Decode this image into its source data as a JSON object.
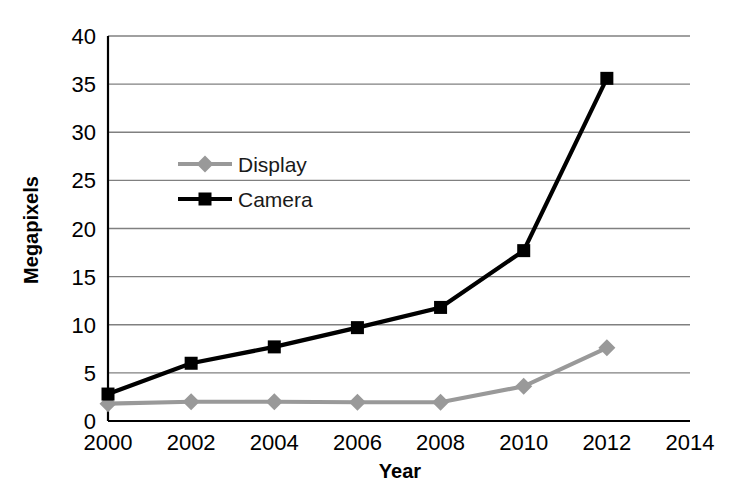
{
  "chart_data": {
    "type": "line",
    "title": "",
    "xlabel": "Year",
    "ylabel": "Megapixels",
    "x": [
      2000,
      2002,
      2004,
      2006,
      2008,
      2010,
      2012
    ],
    "xticks": [
      "2000",
      "2002",
      "2004",
      "2006",
      "2008",
      "2010",
      "2012",
      "2014"
    ],
    "xtick_values": [
      2000,
      2002,
      2004,
      2006,
      2008,
      2010,
      2012,
      2014
    ],
    "yticks": [
      "0",
      "5",
      "10",
      "15",
      "20",
      "25",
      "30",
      "35",
      "40"
    ],
    "ytick_values": [
      0,
      5,
      10,
      15,
      20,
      25,
      30,
      35,
      40
    ],
    "xlim": [
      2000,
      2014
    ],
    "ylim": [
      0,
      40
    ],
    "grid": "horizontal",
    "legend_position": "upper-left-inside",
    "series": [
      {
        "name": "Display",
        "color": "#999999",
        "marker": "diamond",
        "values": [
          1.8,
          2.0,
          2.0,
          1.95,
          1.95,
          3.6,
          7.6
        ]
      },
      {
        "name": "Camera",
        "color": "#000000",
        "marker": "square",
        "values": [
          2.8,
          6.0,
          7.7,
          9.7,
          11.8,
          17.7,
          35.6
        ]
      }
    ]
  },
  "legend": {
    "items": [
      {
        "label": "Display"
      },
      {
        "label": "Camera"
      }
    ]
  },
  "axes": {
    "y_title": "Megapixels",
    "x_title": "Year"
  },
  "colors": {
    "camera": "#000000",
    "display": "#999999",
    "grid": "#808080",
    "frame": "#000000",
    "background": "#ffffff"
  }
}
